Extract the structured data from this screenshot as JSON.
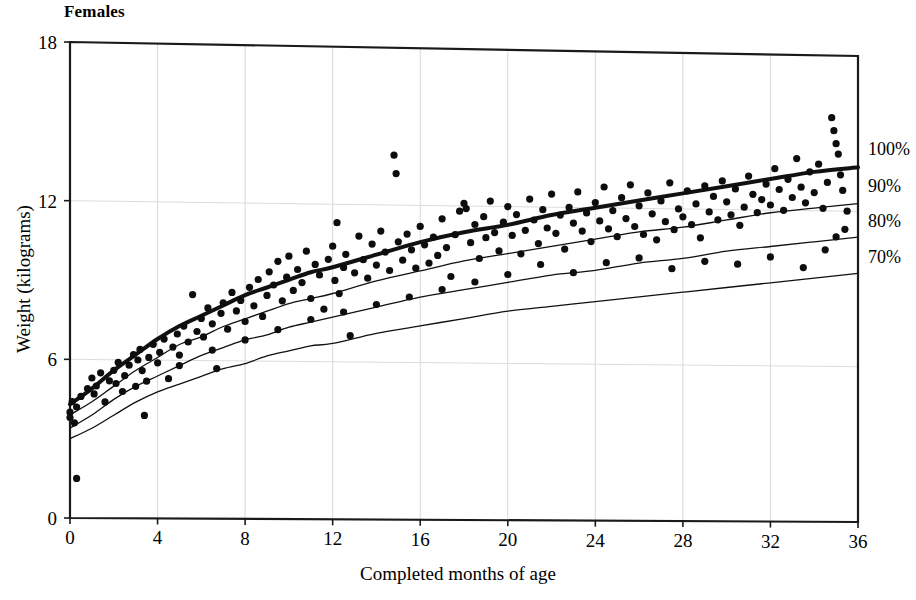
{
  "chart_data": {
    "type": "scatter",
    "title": "Females",
    "xlabel": "Completed months of age",
    "ylabel": "Weight (kilograms)",
    "xlim": [
      0,
      36
    ],
    "ylim": [
      0,
      18
    ],
    "xticks": [
      0,
      4,
      8,
      12,
      16,
      20,
      24,
      28,
      32,
      36
    ],
    "yticks": [
      0,
      6,
      12,
      18
    ],
    "grid": true,
    "legend_position": "right-outside",
    "legend_entries": [
      "100%",
      "90%",
      "80%",
      "70%"
    ],
    "reference_curves": [
      {
        "name": "100%",
        "label": "100%",
        "linewidth": "thick",
        "x": [
          0,
          1,
          2,
          3,
          4,
          5,
          6,
          7,
          8,
          9,
          10,
          11,
          12,
          14,
          16,
          18,
          20,
          22,
          24,
          26,
          28,
          30,
          32,
          34,
          36
        ],
        "y": [
          4.3,
          4.9,
          5.6,
          6.2,
          6.8,
          7.3,
          7.7,
          8.1,
          8.5,
          8.8,
          9.1,
          9.4,
          9.6,
          10.1,
          10.6,
          11.0,
          11.3,
          11.7,
          12.0,
          12.3,
          12.6,
          12.9,
          13.2,
          13.5,
          13.7
        ]
      },
      {
        "name": "90%",
        "label": "90%",
        "linewidth": "thin",
        "x": [
          0,
          1,
          2,
          3,
          4,
          5,
          6,
          7,
          8,
          9,
          10,
          11,
          12,
          14,
          16,
          18,
          20,
          22,
          24,
          26,
          28,
          30,
          32,
          34,
          36
        ],
        "y": [
          3.9,
          4.4,
          5.0,
          5.6,
          6.1,
          6.6,
          6.9,
          7.3,
          7.6,
          7.9,
          8.2,
          8.4,
          8.6,
          9.1,
          9.5,
          9.9,
          10.2,
          10.5,
          10.8,
          11.1,
          11.3,
          11.6,
          11.9,
          12.1,
          12.3
        ]
      },
      {
        "name": "80%",
        "label": "80%",
        "linewidth": "thin",
        "x": [
          0,
          1,
          2,
          3,
          4,
          5,
          6,
          7,
          8,
          9,
          10,
          11,
          12,
          14,
          16,
          18,
          20,
          22,
          24,
          26,
          28,
          30,
          32,
          34,
          36
        ],
        "y": [
          3.4,
          3.9,
          4.5,
          5.0,
          5.4,
          5.8,
          6.2,
          6.5,
          6.8,
          7.0,
          7.3,
          7.5,
          7.7,
          8.1,
          8.5,
          8.8,
          9.1,
          9.4,
          9.6,
          9.9,
          10.1,
          10.4,
          10.6,
          10.8,
          11.0
        ]
      },
      {
        "name": "70%",
        "label": "70%",
        "linewidth": "thin",
        "x": [
          0,
          1,
          2,
          3,
          4,
          5,
          6,
          7,
          8,
          9,
          10,
          11,
          12,
          14,
          16,
          18,
          20,
          22,
          24,
          26,
          28,
          30,
          32,
          34,
          36
        ],
        "y": [
          3.0,
          3.4,
          3.9,
          4.4,
          4.8,
          5.1,
          5.4,
          5.7,
          5.9,
          6.2,
          6.4,
          6.6,
          6.7,
          7.1,
          7.4,
          7.7,
          8.0,
          8.2,
          8.4,
          8.6,
          8.8,
          9.0,
          9.2,
          9.4,
          9.6
        ]
      }
    ],
    "points": [
      [
        0.0,
        4.0
      ],
      [
        0.0,
        3.8
      ],
      [
        0.1,
        4.4
      ],
      [
        0.2,
        3.6
      ],
      [
        0.3,
        1.5
      ],
      [
        0.3,
        4.2
      ],
      [
        0.5,
        4.6
      ],
      [
        0.8,
        4.9
      ],
      [
        1.0,
        5.3
      ],
      [
        1.1,
        4.7
      ],
      [
        1.2,
        5.0
      ],
      [
        1.4,
        5.5
      ],
      [
        1.6,
        4.4
      ],
      [
        1.8,
        5.2
      ],
      [
        2.0,
        5.6
      ],
      [
        2.1,
        5.1
      ],
      [
        2.2,
        5.9
      ],
      [
        2.4,
        4.8
      ],
      [
        2.5,
        5.4
      ],
      [
        2.7,
        5.8
      ],
      [
        2.9,
        6.2
      ],
      [
        3.0,
        5.0
      ],
      [
        3.1,
        6.0
      ],
      [
        3.2,
        6.4
      ],
      [
        3.3,
        5.6
      ],
      [
        3.4,
        3.9
      ],
      [
        3.6,
        6.1
      ],
      [
        3.8,
        6.6
      ],
      [
        4.0,
        5.9
      ],
      [
        4.1,
        6.3
      ],
      [
        4.3,
        6.8
      ],
      [
        4.5,
        5.3
      ],
      [
        4.7,
        6.5
      ],
      [
        4.9,
        7.0
      ],
      [
        5.0,
        6.2
      ],
      [
        5.2,
        7.3
      ],
      [
        5.4,
        6.7
      ],
      [
        5.6,
        8.5
      ],
      [
        5.8,
        7.1
      ],
      [
        6.0,
        7.6
      ],
      [
        6.1,
        6.9
      ],
      [
        6.3,
        8.0
      ],
      [
        6.5,
        7.4
      ],
      [
        6.7,
        5.7
      ],
      [
        6.9,
        7.8
      ],
      [
        7.0,
        8.2
      ],
      [
        7.2,
        7.2
      ],
      [
        7.4,
        8.6
      ],
      [
        7.6,
        7.9
      ],
      [
        7.8,
        8.3
      ],
      [
        8.0,
        7.5
      ],
      [
        8.2,
        8.8
      ],
      [
        8.4,
        8.1
      ],
      [
        8.6,
        9.1
      ],
      [
        8.8,
        7.7
      ],
      [
        9.0,
        8.5
      ],
      [
        9.1,
        9.4
      ],
      [
        9.3,
        8.9
      ],
      [
        9.5,
        9.8
      ],
      [
        9.7,
        8.3
      ],
      [
        9.9,
        9.2
      ],
      [
        10.0,
        10.0
      ],
      [
        10.2,
        8.7
      ],
      [
        10.4,
        9.5
      ],
      [
        10.6,
        9.0
      ],
      [
        10.8,
        10.2
      ],
      [
        11.0,
        8.4
      ],
      [
        11.2,
        9.7
      ],
      [
        11.4,
        9.3
      ],
      [
        11.6,
        8.0
      ],
      [
        11.8,
        9.9
      ],
      [
        12.0,
        10.4
      ],
      [
        12.1,
        9.1
      ],
      [
        12.2,
        11.3
      ],
      [
        12.3,
        8.6
      ],
      [
        12.5,
        9.6
      ],
      [
        12.6,
        10.1
      ],
      [
        12.8,
        7.0
      ],
      [
        13.0,
        9.4
      ],
      [
        13.2,
        10.8
      ],
      [
        13.4,
        9.9
      ],
      [
        13.6,
        9.2
      ],
      [
        13.8,
        10.5
      ],
      [
        14.0,
        9.7
      ],
      [
        14.2,
        11.0
      ],
      [
        14.4,
        10.2
      ],
      [
        14.6,
        9.5
      ],
      [
        14.8,
        13.9
      ],
      [
        14.9,
        13.2
      ],
      [
        15.0,
        10.6
      ],
      [
        15.2,
        9.9
      ],
      [
        15.4,
        10.9
      ],
      [
        15.6,
        10.3
      ],
      [
        15.8,
        9.6
      ],
      [
        16.0,
        11.2
      ],
      [
        16.2,
        10.5
      ],
      [
        16.4,
        9.8
      ],
      [
        16.6,
        10.8
      ],
      [
        16.8,
        10.1
      ],
      [
        17.0,
        11.5
      ],
      [
        17.2,
        10.4
      ],
      [
        17.4,
        9.3
      ],
      [
        17.6,
        10.9
      ],
      [
        17.8,
        11.8
      ],
      [
        18.0,
        12.1
      ],
      [
        18.1,
        11.9
      ],
      [
        18.3,
        10.6
      ],
      [
        18.5,
        11.3
      ],
      [
        18.7,
        10.0
      ],
      [
        18.9,
        11.6
      ],
      [
        19.0,
        10.8
      ],
      [
        19.2,
        12.2
      ],
      [
        19.4,
        11.0
      ],
      [
        19.6,
        10.3
      ],
      [
        19.8,
        11.4
      ],
      [
        20.0,
        12.0
      ],
      [
        20.2,
        10.9
      ],
      [
        20.4,
        11.7
      ],
      [
        20.6,
        10.2
      ],
      [
        20.8,
        11.1
      ],
      [
        21.0,
        12.3
      ],
      [
        21.2,
        11.5
      ],
      [
        21.4,
        10.6
      ],
      [
        21.6,
        11.9
      ],
      [
        21.8,
        11.2
      ],
      [
        22.0,
        12.5
      ],
      [
        22.2,
        11.0
      ],
      [
        22.4,
        11.7
      ],
      [
        22.6,
        10.4
      ],
      [
        22.8,
        12.0
      ],
      [
        23.0,
        11.4
      ],
      [
        23.2,
        12.6
      ],
      [
        23.4,
        11.1
      ],
      [
        23.6,
        11.8
      ],
      [
        23.8,
        10.7
      ],
      [
        24.0,
        12.2
      ],
      [
        24.2,
        11.5
      ],
      [
        24.4,
        12.8
      ],
      [
        24.6,
        11.2
      ],
      [
        24.8,
        11.9
      ],
      [
        25.0,
        10.9
      ],
      [
        25.2,
        12.4
      ],
      [
        25.4,
        11.6
      ],
      [
        25.6,
        12.9
      ],
      [
        25.8,
        11.3
      ],
      [
        26.0,
        12.1
      ],
      [
        26.2,
        11.0
      ],
      [
        26.4,
        12.6
      ],
      [
        26.6,
        11.8
      ],
      [
        26.8,
        10.8
      ],
      [
        27.0,
        12.3
      ],
      [
        27.2,
        11.5
      ],
      [
        27.4,
        13.0
      ],
      [
        27.6,
        11.2
      ],
      [
        27.8,
        12.0
      ],
      [
        28.0,
        11.7
      ],
      [
        28.2,
        12.7
      ],
      [
        28.4,
        11.4
      ],
      [
        28.6,
        12.2
      ],
      [
        28.8,
        10.9
      ],
      [
        29.0,
        12.9
      ],
      [
        29.2,
        11.9
      ],
      [
        29.4,
        12.5
      ],
      [
        29.6,
        11.6
      ],
      [
        29.8,
        13.1
      ],
      [
        30.0,
        12.3
      ],
      [
        30.2,
        11.8
      ],
      [
        30.4,
        12.8
      ],
      [
        30.6,
        11.4
      ],
      [
        30.8,
        12.1
      ],
      [
        31.0,
        13.3
      ],
      [
        31.2,
        12.6
      ],
      [
        31.4,
        11.9
      ],
      [
        31.6,
        12.4
      ],
      [
        31.8,
        13.0
      ],
      [
        32.0,
        12.2
      ],
      [
        32.2,
        13.6
      ],
      [
        32.4,
        12.8
      ],
      [
        32.6,
        12.0
      ],
      [
        32.8,
        13.2
      ],
      [
        33.0,
        12.5
      ],
      [
        33.2,
        14.0
      ],
      [
        33.4,
        12.9
      ],
      [
        33.6,
        12.3
      ],
      [
        33.8,
        13.5
      ],
      [
        34.0,
        12.7
      ],
      [
        34.2,
        13.8
      ],
      [
        34.4,
        12.1
      ],
      [
        34.6,
        13.1
      ],
      [
        34.8,
        15.6
      ],
      [
        34.9,
        15.1
      ],
      [
        35.0,
        14.6
      ],
      [
        35.1,
        14.2
      ],
      [
        35.2,
        13.4
      ],
      [
        35.3,
        12.8
      ],
      [
        35.4,
        11.3
      ],
      [
        35.5,
        12.0
      ],
      [
        35.0,
        11.0
      ],
      [
        34.5,
        10.5
      ],
      [
        33.5,
        9.8
      ],
      [
        32.0,
        10.2
      ],
      [
        30.5,
        9.9
      ],
      [
        29.0,
        10.0
      ],
      [
        27.5,
        9.7
      ],
      [
        26.0,
        10.1
      ],
      [
        24.5,
        9.9
      ],
      [
        23.0,
        9.5
      ],
      [
        21.5,
        9.8
      ],
      [
        20.0,
        9.4
      ],
      [
        18.5,
        9.1
      ],
      [
        17.0,
        8.8
      ],
      [
        15.5,
        8.5
      ],
      [
        14.0,
        8.2
      ],
      [
        12.5,
        7.9
      ],
      [
        11.0,
        7.6
      ],
      [
        9.5,
        7.2
      ],
      [
        8.0,
        6.8
      ],
      [
        6.5,
        6.4
      ],
      [
        5.0,
        5.8
      ],
      [
        3.5,
        5.2
      ]
    ]
  }
}
